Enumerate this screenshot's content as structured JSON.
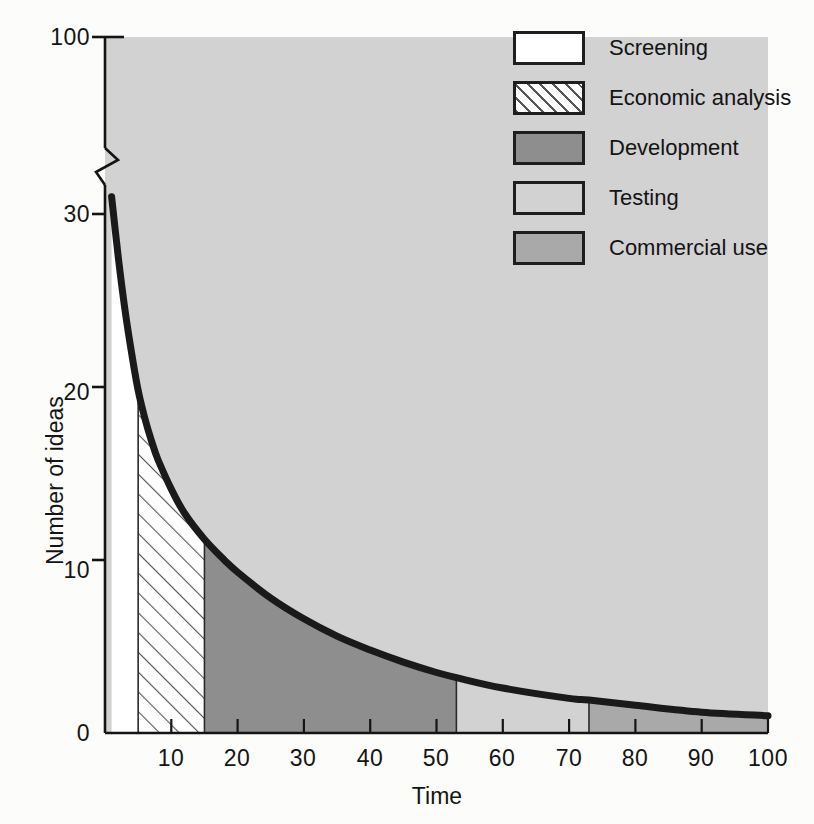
{
  "chart_data": {
    "type": "area",
    "title": "",
    "xlabel": "Time",
    "ylabel": "Number of ideas",
    "xlim": [
      0,
      100
    ],
    "ylim": [
      0,
      30
    ],
    "y_axis_break": {
      "below": 30,
      "above": 100,
      "note": "axis broken between 30 and 100"
    },
    "xticks": [
      10,
      20,
      30,
      40,
      50,
      60,
      70,
      80,
      90,
      100
    ],
    "xtick_labels": [
      "10",
      "20",
      "30",
      "40",
      "50",
      "60",
      "70",
      "80",
      "90",
      "100"
    ],
    "yticks": [
      0,
      10,
      20,
      30,
      100
    ],
    "ytick_labels": [
      "0",
      "10",
      "20",
      "30",
      "100"
    ],
    "grid": false,
    "legend_position": "top-right",
    "curve_name": "Number of ideas remaining",
    "x": [
      1,
      2,
      3,
      4,
      5,
      6,
      7,
      8,
      10,
      12,
      15,
      18,
      20,
      25,
      30,
      35,
      40,
      45,
      50,
      53,
      60,
      70,
      73,
      80,
      90,
      100
    ],
    "y": [
      31,
      27.5,
      24.5,
      22,
      19.8,
      18.2,
      16.9,
      15.8,
      14.1,
      12.7,
      11.2,
      10.0,
      9.3,
      7.8,
      6.6,
      5.6,
      4.8,
      4.1,
      3.5,
      3.2,
      2.6,
      2.0,
      1.9,
      1.6,
      1.2,
      1.0
    ],
    "stages": [
      {
        "name": "Screening",
        "x_start": 0,
        "x_end": 5,
        "fill": "white",
        "color": "#ffffff"
      },
      {
        "name": "Economic analysis",
        "x_start": 5,
        "x_end": 15,
        "fill": "hatched",
        "color": "#ffffff"
      },
      {
        "name": "Development",
        "x_start": 15,
        "x_end": 53,
        "fill": "dark-gray",
        "color": "#8e8e8e"
      },
      {
        "name": "Testing",
        "x_start": 53,
        "x_end": 73,
        "fill": "light-gray",
        "color": "#d2d2d2"
      },
      {
        "name": "Commercial use",
        "x_start": 73,
        "x_end": 100,
        "fill": "mid-gray",
        "color": "#a9a9a9"
      }
    ]
  },
  "legend": {
    "items": [
      {
        "label": "Screening",
        "swatch": "sw-screening"
      },
      {
        "label": "Economic analysis",
        "swatch": "sw-economic"
      },
      {
        "label": "Development",
        "swatch": "sw-development"
      },
      {
        "label": "Testing",
        "swatch": "sw-testing"
      },
      {
        "label": "Commercial use",
        "swatch": "sw-commercial"
      }
    ]
  },
  "colors": {
    "plot_background": "#d2d2d2",
    "page_background": "#fcfcfa",
    "axis": "#141414",
    "curve": "#1a1a1a",
    "development": "#8e8e8e",
    "testing": "#d2d2d2",
    "commercial": "#a9a9a9"
  }
}
